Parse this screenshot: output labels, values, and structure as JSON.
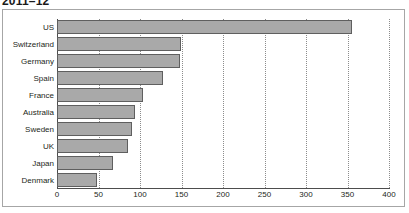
{
  "title": "2011–12",
  "colors": {
    "bar_fill": "#a9a9a9",
    "bar_stroke": "#5f5f5f",
    "gridline": "#8c8c8c",
    "axis": "#4d4d4d",
    "frame": "#a6a6a6",
    "text": "#231f20",
    "background": "#ffffff"
  },
  "chart_data": {
    "type": "bar",
    "orientation": "horizontal",
    "title": "2011–12",
    "xlabel": "",
    "ylabel": "",
    "categories": [
      "US",
      "Switzerland",
      "Germany",
      "Spain",
      "France",
      "Australia",
      "Sweden",
      "UK",
      "Japan",
      "Denmark"
    ],
    "values": [
      355,
      149,
      148,
      128,
      104,
      94,
      90,
      85,
      67,
      48
    ],
    "xlim": [
      0,
      400
    ],
    "ylim": null,
    "xticks": [
      0,
      50,
      100,
      150,
      200,
      250,
      300,
      350,
      400
    ],
    "xtick_labels": [
      "0",
      "50",
      "100",
      "150",
      "200",
      "250",
      "300",
      "350",
      "400"
    ],
    "grid": "vertical-dotted",
    "legend": null,
    "legend_position": "none",
    "annotations": []
  }
}
